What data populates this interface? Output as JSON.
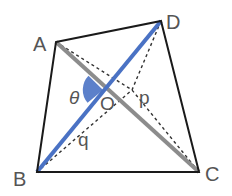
{
  "diagram": {
    "type": "quadrilateral-diagonals",
    "colors": {
      "outline": "#1a1a1a",
      "diagonal_ac": "#8c8c8c",
      "diagonal_bd": "#4a72c4",
      "angle_fill": "#4a72c4",
      "dashed": "#333333",
      "label": "#555555"
    },
    "vertices": {
      "A": {
        "label": "A",
        "x": 56,
        "y": 42
      },
      "B": {
        "label": "B",
        "x": 37,
        "y": 172
      },
      "C": {
        "label": "C",
        "x": 199,
        "y": 172
      },
      "D": {
        "label": "D",
        "x": 161,
        "y": 21
      }
    },
    "intersection": {
      "label": "O",
      "x": 103,
      "y": 90
    },
    "angle": {
      "label": "θ"
    },
    "segment_labels": {
      "p": "p",
      "q": "q"
    }
  }
}
